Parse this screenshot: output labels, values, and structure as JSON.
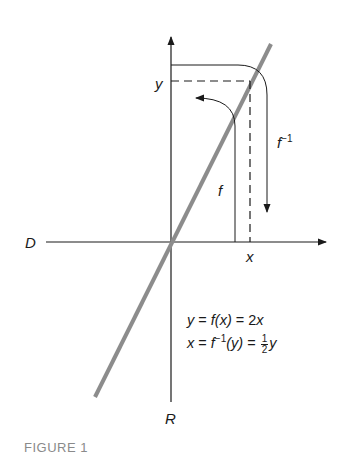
{
  "figure": {
    "caption": "FIGURE 1",
    "labels": {
      "domain": "D",
      "range": "R",
      "x": "x",
      "y": "y",
      "f": "f",
      "f_inverse_base": "f",
      "f_inverse_sup": "−1"
    },
    "equations": {
      "line1_lhs": "y",
      "line1_eq1": " = ",
      "line1_mid": "f(x)",
      "line1_eq2": " = 2",
      "line1_rhs": "x",
      "line2_lhs": "x",
      "line2_eq1": " = ",
      "line2_f": "f",
      "line2_sup": "−1",
      "line2_arg": "(y)",
      "line2_eq2": " = ",
      "frac_num": "1",
      "frac_den": "2",
      "line2_rhs": "y"
    },
    "colors": {
      "axis": "#1a1a1a",
      "graph_line": "#8c8c8c",
      "caption": "#8a8a8a"
    }
  }
}
